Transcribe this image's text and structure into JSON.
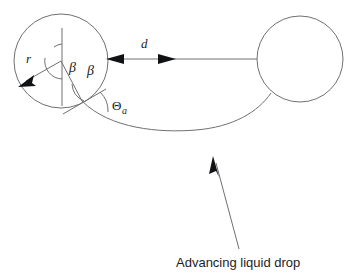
{
  "figure": {
    "background_color": "#ffffff",
    "line_color": "#6f7073",
    "text_color": "#1b1c1e",
    "labels": {
      "radius": "r",
      "separation": "d",
      "beta_left": "β",
      "beta_right": "β",
      "contact_angle": "Θ",
      "contact_angle_subscript": "a"
    },
    "caption": "Advancing liquid drop",
    "elements": {
      "left_particle": {
        "name": "left-circle",
        "center_x": 61,
        "center_y": 61,
        "radius": 47
      },
      "right_particle": {
        "name": "right-circle",
        "center_x": 300,
        "center_y": 59,
        "radius": 43
      },
      "separation_arrow": {
        "name": "separation-arrow",
        "from_x": 108,
        "to_x": 257,
        "y": 59,
        "double_headed": true
      },
      "liquid_meniscus": {
        "name": "meniscus-curve",
        "start_x": 82,
        "start_y": 101,
        "end_x": 270,
        "end_y": 92,
        "lowest_y": 130
      },
      "caption_pointer": {
        "name": "caption-pointer-arrow",
        "from_x": 239,
        "from_y": 249,
        "to_x": 213,
        "to_y": 156
      }
    }
  }
}
